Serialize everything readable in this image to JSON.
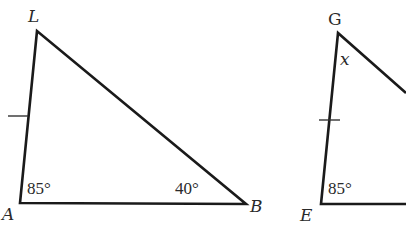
{
  "diagram": {
    "colors": {
      "stroke": "#1a1a1a",
      "text": "#2a2a2a",
      "background": "#ffffff"
    },
    "triangle_left": {
      "vertices": {
        "top": "L",
        "bottom_left": "A",
        "bottom_right": "B"
      },
      "angles": {
        "A": "85°",
        "B": "40°"
      },
      "congruent_side": "LA"
    },
    "triangle_right": {
      "vertices": {
        "top": "G",
        "bottom_left": "E"
      },
      "angles": {
        "E": "85°",
        "G": "x"
      },
      "congruent_side": "GE"
    }
  }
}
